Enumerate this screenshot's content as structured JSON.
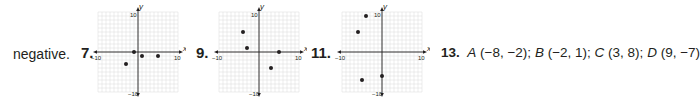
{
  "lead_text": "negative.",
  "answer_13": {
    "number": "13.",
    "text_parts": [
      {
        "label": "A",
        "coords": "(−8, −2);"
      },
      {
        "label": "B",
        "coords": "(−2, 1);"
      },
      {
        "label": "C",
        "coords": "(3, 8);"
      },
      {
        "label": "D",
        "coords": "(9, −7)"
      }
    ]
  },
  "chart_data": [
    {
      "type": "scatter",
      "number": "7.",
      "xlabel": "x",
      "ylabel": "y",
      "xlim": [
        -10,
        10
      ],
      "ylim": [
        -10,
        10
      ],
      "tick_labels": {
        "x_min": "−10",
        "x_max": "10",
        "y_max": "10",
        "y_min": "−10"
      },
      "grid": true,
      "points": [
        [
          -1,
          0
        ],
        [
          1,
          -1
        ],
        [
          5,
          -1
        ],
        [
          -3,
          -3
        ]
      ]
    },
    {
      "type": "scatter",
      "number": "9.",
      "xlabel": "x",
      "ylabel": "y",
      "xlim": [
        -10,
        10
      ],
      "ylim": [
        -10,
        10
      ],
      "tick_labels": {
        "x_min": "−10",
        "x_max": "10",
        "y_max": "10",
        "y_min": "−10"
      },
      "grid": true,
      "points": [
        [
          -4,
          5
        ],
        [
          -3,
          1
        ],
        [
          5,
          0
        ],
        [
          3,
          -4
        ]
      ]
    },
    {
      "type": "scatter",
      "number": "11.",
      "xlabel": "x",
      "ylabel": "y",
      "xlim": [
        -10,
        10
      ],
      "ylim": [
        -10,
        10
      ],
      "tick_labels": {
        "x_min": "−10",
        "x_max": "10",
        "y_max": "10",
        "y_min": "−10"
      },
      "grid": true,
      "points": [
        [
          -4,
          9
        ],
        [
          -6,
          5
        ],
        [
          -5,
          -7
        ],
        [
          0,
          -6
        ]
      ]
    }
  ]
}
